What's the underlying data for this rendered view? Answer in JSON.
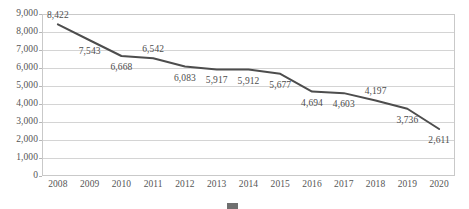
{
  "chart_data": {
    "type": "line",
    "title": "",
    "subtitle": "",
    "xlabel": "",
    "ylabel": "",
    "categories": [
      "2008",
      "2009",
      "2010",
      "2011",
      "2012",
      "2013",
      "2014",
      "2015",
      "2016",
      "2017",
      "2018",
      "2019",
      "2020"
    ],
    "values": [
      8422,
      7543,
      6668,
      6542,
      6083,
      5917,
      5912,
      5677,
      4694,
      4603,
      4197,
      3736,
      2611
    ],
    "point_labels": [
      "8,422",
      "7,543",
      "6,668",
      "6,542",
      "6,083",
      "5,917",
      "5,912",
      "5,677",
      "4,694",
      "4,603",
      "4,197",
      "3,736",
      "2,611"
    ],
    "label_placement": [
      "above",
      "below",
      "below",
      "above",
      "below",
      "below",
      "below",
      "below",
      "below",
      "below",
      "above",
      "below",
      "below"
    ],
    "series": [
      {
        "name": "",
        "values": [
          8422,
          7543,
          6668,
          6542,
          6083,
          5917,
          5912,
          5677,
          4694,
          4603,
          4197,
          3736,
          2611
        ],
        "color": "#4d4d4d"
      }
    ],
    "ylim": [
      0,
      9000
    ],
    "ytick_step": 1000,
    "ytick_labels": [
      "9,000",
      "8,000",
      "7,000",
      "6,000",
      "5,000",
      "4,000",
      "3,000",
      "2,000",
      "1,000",
      "0"
    ],
    "ytick_values": [
      9000,
      8000,
      7000,
      6000,
      5000,
      4000,
      3000,
      2000,
      1000,
      0
    ],
    "grid": true,
    "grid_axis": "y",
    "legend": "none",
    "colors": {
      "line": "#4d4d4d",
      "grid": "#d4d4d4",
      "frame": "#c9c9c9",
      "text": "#555555",
      "background": "#ffffff"
    }
  },
  "caption": {
    "swatch_color": "#6f6f6f",
    "text": ""
  }
}
